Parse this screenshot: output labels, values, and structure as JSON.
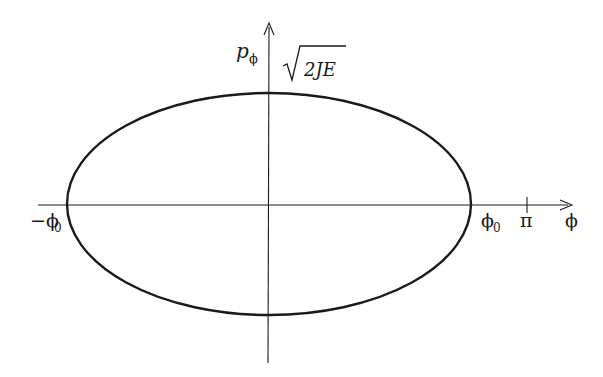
{
  "diagram": {
    "type": "phase-space-ellipse",
    "axes": {
      "x_label": "ϕ",
      "y_label_main": "p",
      "y_label_sub": "ϕ"
    },
    "labels": {
      "top_intercept": "2JE",
      "left_intercept_main": "−ϕ",
      "left_intercept_sub": "0",
      "right_intercept_main": "ϕ",
      "right_intercept_sub": "0",
      "pi_tick": "π"
    },
    "colors": {
      "stroke": "#1a1a1a",
      "background": "#ffffff"
    }
  }
}
